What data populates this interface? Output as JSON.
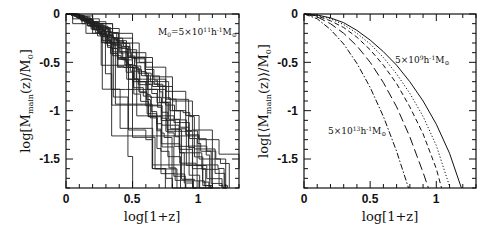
{
  "chart_data": [
    {
      "type": "line",
      "panel": "left",
      "title": "",
      "xlabel": "log[1+z]",
      "ylabel": "log[M_main(z)/M_0]",
      "xlim": [
        0,
        1.3
      ],
      "ylim": [
        -1.8,
        0
      ],
      "xticks": [
        0,
        0.5,
        1
      ],
      "xtick_labels": [
        "0",
        "0.5",
        "1"
      ],
      "yticks": [
        0,
        -0.5,
        -1,
        -1.5
      ],
      "ytick_labels": [
        "0",
        "-0.5",
        "-1",
        "-1.5"
      ],
      "annotation": "M0=5×10^11 h^-1 M☉",
      "grid": false,
      "description": "Step-like main-progenitor mass accretion histories for ~25 individual halo realizations",
      "series": [
        {
          "name": "track-1",
          "x": [
            0,
            0.05,
            0.12,
            0.2,
            0.3,
            0.42,
            0.5,
            0.6,
            0.72,
            0.85,
            0.95,
            1.05
          ],
          "y": [
            0,
            -0.05,
            -0.1,
            -0.2,
            -0.3,
            -0.45,
            -0.7,
            -0.95,
            -1.15,
            -1.4,
            -1.6,
            -1.8
          ]
        },
        {
          "name": "track-2",
          "x": [
            0,
            0.08,
            0.18,
            0.3,
            0.4,
            0.55,
            0.65,
            0.8,
            0.9,
            1.0,
            1.1
          ],
          "y": [
            0,
            -0.03,
            -0.08,
            -0.15,
            -0.3,
            -0.5,
            -0.75,
            -1.0,
            -1.25,
            -1.5,
            -1.8
          ]
        },
        {
          "name": "track-3",
          "x": [
            0,
            0.1,
            0.25,
            0.35,
            0.5,
            0.6,
            0.75,
            0.9,
            1.0,
            1.15,
            1.3
          ],
          "y": [
            0,
            -0.05,
            -0.1,
            -0.25,
            -0.4,
            -0.55,
            -0.8,
            -1.05,
            -1.3,
            -1.45,
            -1.6
          ]
        },
        {
          "name": "track-4",
          "x": [
            0,
            0.05,
            0.15,
            0.3,
            0.45,
            0.47,
            0.6,
            0.65,
            0.75,
            0.8
          ],
          "y": [
            0,
            -0.1,
            -0.2,
            -0.3,
            -0.5,
            -1.2,
            -1.3,
            -1.6,
            -1.7,
            -1.8
          ]
        },
        {
          "name": "track-5",
          "x": [
            0,
            0.1,
            0.2,
            0.35,
            0.5,
            0.65,
            0.8,
            0.95,
            1.1,
            1.2
          ],
          "y": [
            0,
            -0.02,
            -0.1,
            -0.2,
            -0.45,
            -0.65,
            -0.9,
            -1.2,
            -1.5,
            -1.8
          ]
        }
      ]
    },
    {
      "type": "line",
      "panel": "right",
      "title": "",
      "xlabel": "log[1+z]",
      "ylabel": "log[⟨M_main(z)⟩/M_0]",
      "xlim": [
        0,
        1.3
      ],
      "ylim": [
        -1.8,
        0
      ],
      "xticks": [
        0,
        0.5,
        1
      ],
      "xtick_labels": [
        "0",
        "0.5",
        "1"
      ],
      "yticks": [
        0,
        -0.5,
        -1,
        -1.5
      ],
      "ytick_labels": [
        "0",
        "-0.5",
        "-1",
        "-1.5"
      ],
      "annotations": [
        "5×10^9 h^-1 M☉",
        "5×10^13 h^-1 M☉"
      ],
      "grid": false,
      "series": [
        {
          "name": "5e9 (solid)",
          "style": "solid",
          "x": [
            0,
            0.1,
            0.2,
            0.3,
            0.4,
            0.5,
            0.6,
            0.7,
            0.8,
            0.9,
            1.0,
            1.1,
            1.19
          ],
          "y": [
            0,
            -0.01,
            -0.04,
            -0.09,
            -0.17,
            -0.27,
            -0.39,
            -0.53,
            -0.7,
            -0.9,
            -1.14,
            -1.44,
            -1.8
          ]
        },
        {
          "name": "5e10 (dotted)",
          "style": "dotted",
          "x": [
            0,
            0.1,
            0.2,
            0.3,
            0.4,
            0.5,
            0.6,
            0.7,
            0.8,
            0.9,
            1.0,
            1.1
          ],
          "y": [
            0,
            -0.015,
            -0.05,
            -0.11,
            -0.2,
            -0.31,
            -0.45,
            -0.62,
            -0.82,
            -1.06,
            -1.36,
            -1.78
          ]
        },
        {
          "name": "5e11 (short dash)",
          "style": "short-dash",
          "x": [
            0,
            0.1,
            0.2,
            0.3,
            0.4,
            0.5,
            0.6,
            0.7,
            0.8,
            0.9,
            1.0,
            1.04
          ],
          "y": [
            0,
            -0.02,
            -0.07,
            -0.14,
            -0.24,
            -0.37,
            -0.53,
            -0.72,
            -0.96,
            -1.24,
            -1.6,
            -1.8
          ]
        },
        {
          "name": "5e12 (long dash)",
          "style": "long-dash",
          "x": [
            0,
            0.1,
            0.2,
            0.3,
            0.4,
            0.5,
            0.6,
            0.7,
            0.8,
            0.9,
            0.94
          ],
          "y": [
            0,
            -0.03,
            -0.1,
            -0.2,
            -0.33,
            -0.5,
            -0.71,
            -0.96,
            -1.27,
            -1.64,
            -1.8
          ]
        },
        {
          "name": "5e13 (dot-dash)",
          "style": "dot-dash",
          "x": [
            0,
            0.1,
            0.2,
            0.3,
            0.4,
            0.5,
            0.6,
            0.7,
            0.79
          ],
          "y": [
            0,
            -0.05,
            -0.16,
            -0.31,
            -0.51,
            -0.76,
            -1.06,
            -1.42,
            -1.8
          ]
        }
      ]
    }
  ],
  "labels": {
    "left": {
      "ylabel": "log[M",
      "ylabel_sub": "main",
      "ylabel_rest": "(z)/M",
      "ylabel_sub2": "0",
      "ylabel_end": "]",
      "xlabel": "log[1+z]",
      "annot_pre": "M",
      "annot_sub": "0",
      "annot_mid": "=5×10",
      "annot_sup": "11",
      "annot_h": "h",
      "annot_hsup": "-1",
      "annot_msun": "M",
      "annot_sunsub": "⊙"
    },
    "right": {
      "ylabel": "log[⟨M",
      "ylabel_sub": "main",
      "ylabel_rest": "(z)⟩/M",
      "ylabel_sub2": "0",
      "ylabel_end": "]",
      "xlabel": "log[1+z]",
      "annot1_mid": "5×10",
      "annot1_sup": "9",
      "annot2_mid": "5×10",
      "annot2_sup": "13",
      "annot_h": "h",
      "annot_hsup": "-1",
      "annot_msun": "M",
      "annot_sunsub": "⊙"
    },
    "ticks": {
      "x0": "0",
      "x1": "0.5",
      "x2": "1",
      "y0": "0",
      "y1": "-0.5",
      "y2": "-1",
      "y3": "-1.5"
    }
  }
}
